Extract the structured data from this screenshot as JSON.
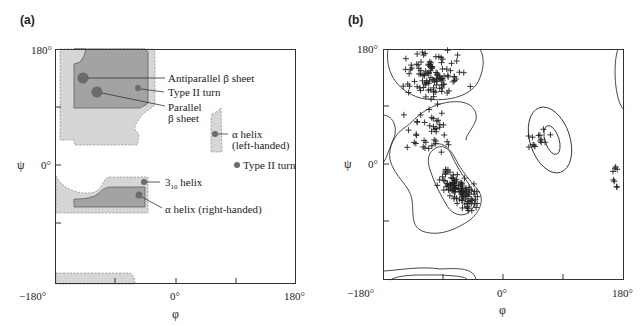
{
  "figure": {
    "panel_a": {
      "label": "(a)",
      "y_axis_symbol": "ψ",
      "x_axis_symbol": "φ",
      "ticks": {
        "y_top": "180°",
        "y_mid": "0°",
        "x_left": "−180°",
        "x_mid": "0°",
        "x_right": "180°"
      },
      "annotations": {
        "antiparallel": "Antiparallel β sheet",
        "type2_turn_upper": "Type II turn",
        "parallel_line1": "Parallel",
        "parallel_line2": "β sheet",
        "alpha_left_line1": "α helix",
        "alpha_left_line2": "(left-handed)",
        "type2_turn_right": "Type II turn",
        "helix310_base": "3",
        "helix310_sub": "10",
        "helix310_rest": " helix",
        "alpha_right": "α helix (right-handed)"
      },
      "colors": {
        "allowed_region": "#d4d4d4",
        "favored_region": "#9a9a9a",
        "dot": "#6a6a6a"
      }
    },
    "panel_b": {
      "label": "(b)",
      "y_axis_symbol": "ψ",
      "x_axis_symbol": "φ",
      "ticks": {
        "y_top": "180°",
        "y_mid": "0°",
        "x_left": "−180°",
        "x_mid": "0°",
        "x_right": "180°"
      }
    }
  },
  "chart_data": [
    {
      "type": "scatter",
      "title": "(a) Ramachandran plot – secondary structure regions",
      "xlabel": "φ",
      "ylabel": "ψ",
      "xlim": [
        -180,
        180
      ],
      "ylim": [
        -180,
        180
      ],
      "x_ticks": [
        "−180°",
        "0°",
        "180°"
      ],
      "y_ticks": [
        "0°",
        "180°"
      ],
      "grid": false,
      "points": [
        {
          "label": "Antiparallel β sheet",
          "phi": -140,
          "psi": 135
        },
        {
          "label": "Parallel β sheet",
          "phi": -120,
          "psi": 115
        },
        {
          "label": "Type II turn",
          "phi": -60,
          "psi": 120
        },
        {
          "label": "α helix (left-handed)",
          "phi": 60,
          "psi": 45
        },
        {
          "label": "Type II turn",
          "phi": 90,
          "psi": 0
        },
        {
          "label": "3₁₀ helix",
          "phi": -50,
          "psi": -25
        },
        {
          "label": "α helix (right-handed)",
          "phi": -57,
          "psi": -47
        }
      ],
      "regions": [
        "fully allowed (dark gray)",
        "outer limit (light gray, dashed)"
      ]
    },
    {
      "type": "scatter",
      "title": "(b) Observed φ/ψ angles with contours",
      "xlabel": "φ",
      "ylabel": "ψ",
      "xlim": [
        -180,
        180
      ],
      "ylim": [
        -180,
        180
      ],
      "x_ticks": [
        "−180°",
        "0°",
        "180°"
      ],
      "y_ticks": [
        "0°",
        "180°"
      ],
      "grid": false,
      "clusters": [
        {
          "region": "β sheet",
          "phi_center": -100,
          "psi_center": 140,
          "approx_points": 110
        },
        {
          "region": "bridge / polyproline",
          "phi_center": -110,
          "psi_center": 50,
          "approx_points": 40
        },
        {
          "region": "right-handed α helix",
          "phi_center": -65,
          "psi_center": -40,
          "approx_points": 120
        },
        {
          "region": "left-handed α helix",
          "phi_center": 55,
          "psi_center": 40,
          "approx_points": 14
        },
        {
          "region": "φ≈+170 scattered",
          "phi_center": 170,
          "psi_center": -10,
          "approx_points": 8
        }
      ]
    }
  ]
}
